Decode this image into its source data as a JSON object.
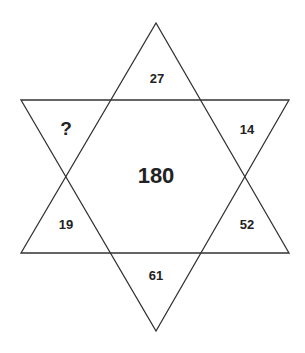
{
  "puzzle": {
    "type": "six-pointed star number puzzle",
    "center_value": "180",
    "points": [
      {
        "position": "top",
        "value": "27"
      },
      {
        "position": "upper-right",
        "value": "14"
      },
      {
        "position": "lower-right",
        "value": "52"
      },
      {
        "position": "bottom",
        "value": "61"
      },
      {
        "position": "lower-left",
        "value": "19"
      },
      {
        "position": "upper-left",
        "value": "?"
      }
    ]
  },
  "colors": {
    "line": "#333333",
    "text": "#222222",
    "background": "#ffffff"
  }
}
